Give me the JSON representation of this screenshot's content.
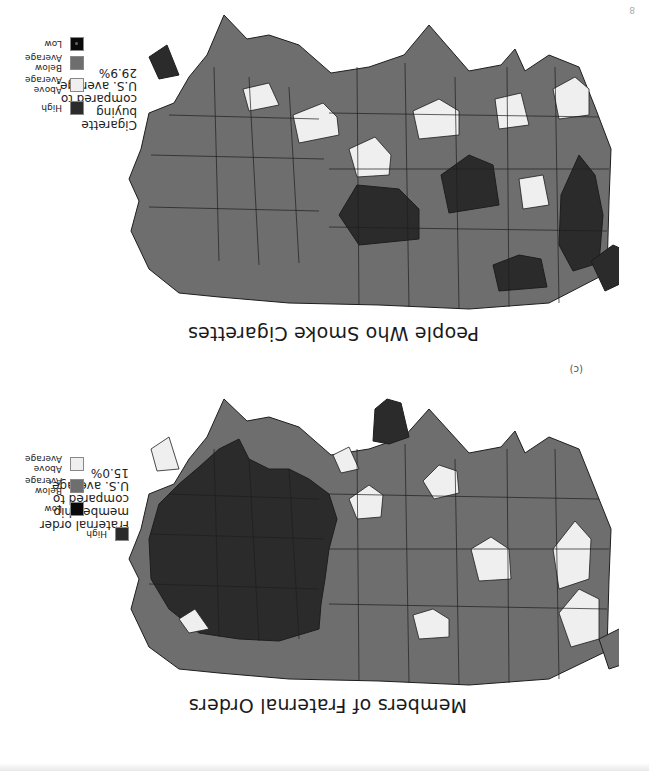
{
  "page": {
    "orientation": "rotated 180 degrees",
    "corner_mark": "8"
  },
  "maps": [
    {
      "id": "fraternal",
      "title": "Members of Fraternal Orders",
      "panel_label": "",
      "legend": {
        "caption_lines": [
          "Fraternal order",
          "membership",
          "compared to",
          "U.S. average,",
          "15.0%"
        ],
        "items": [
          {
            "label_lines": [
              "High"
            ],
            "color": "#2b2b2b"
          },
          {
            "label_lines": [
              "Above",
              "Average"
            ],
            "color": "#efefef"
          },
          {
            "label_lines": [
              "Below",
              "Average"
            ],
            "color": "#6e6e6e"
          },
          {
            "label_lines": [
              "Low"
            ],
            "color": "#0a0a0a"
          }
        ]
      }
    },
    {
      "id": "cigarettes",
      "title": "People Who Smoke Cigarettes",
      "panel_label": "(c)",
      "legend": {
        "caption_lines": [
          "Cigarette",
          "buying",
          "compared to",
          "U.S. average,",
          "29.9%"
        ],
        "items": [
          {
            "label_lines": [
              "High"
            ],
            "color": "#2b2b2b"
          },
          {
            "label_lines": [
              "Above",
              "Average"
            ],
            "color": "#efefef"
          },
          {
            "label_lines": [
              "Below",
              "Average"
            ],
            "color": "#6e6e6e"
          },
          {
            "label_lines": [
              "Low"
            ],
            "color": "#0a0a0a"
          }
        ]
      }
    }
  ],
  "colors": {
    "high": "#2b2b2b",
    "above_average": "#efefef",
    "below_average": "#6e6e6e",
    "low": "#0a0a0a",
    "border": "#1e1e1e"
  }
}
